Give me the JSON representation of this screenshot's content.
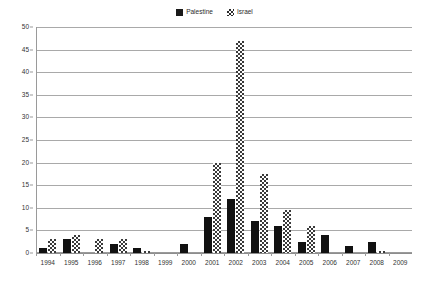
{
  "chart_data": {
    "type": "bar",
    "title": "",
    "xlabel": "",
    "ylabel": "",
    "ylim": [
      0,
      50
    ],
    "ytick_step": 5,
    "yticks": [
      0,
      5,
      10,
      15,
      20,
      25,
      30,
      35,
      40,
      45,
      50
    ],
    "grid": true,
    "legend_position": "top-center",
    "categories": [
      "1994",
      "1995",
      "1996",
      "1997",
      "1998",
      "1999",
      "2000",
      "2001",
      "2002",
      "2003",
      "2004",
      "2005",
      "2006",
      "2007",
      "2008",
      "2009"
    ],
    "series": [
      {
        "name": "Palestine",
        "pattern": "solid",
        "color": "#111111",
        "values": [
          1,
          3,
          0,
          2,
          1,
          0,
          2,
          8,
          12,
          7,
          6,
          2.5,
          4,
          1.5,
          2.5,
          0
        ]
      },
      {
        "name": "Israel",
        "pattern": "checkered",
        "color": "#3a3a3a",
        "values": [
          3,
          4,
          3,
          3,
          0.5,
          0,
          0,
          20,
          47,
          17.5,
          9.5,
          6,
          0,
          0,
          0.5,
          0
        ]
      }
    ]
  },
  "legend": {
    "items": [
      {
        "label": "Palestine",
        "swatch": "solid-square-icon"
      },
      {
        "label": "Israel",
        "swatch": "hatched-square-icon"
      }
    ]
  }
}
